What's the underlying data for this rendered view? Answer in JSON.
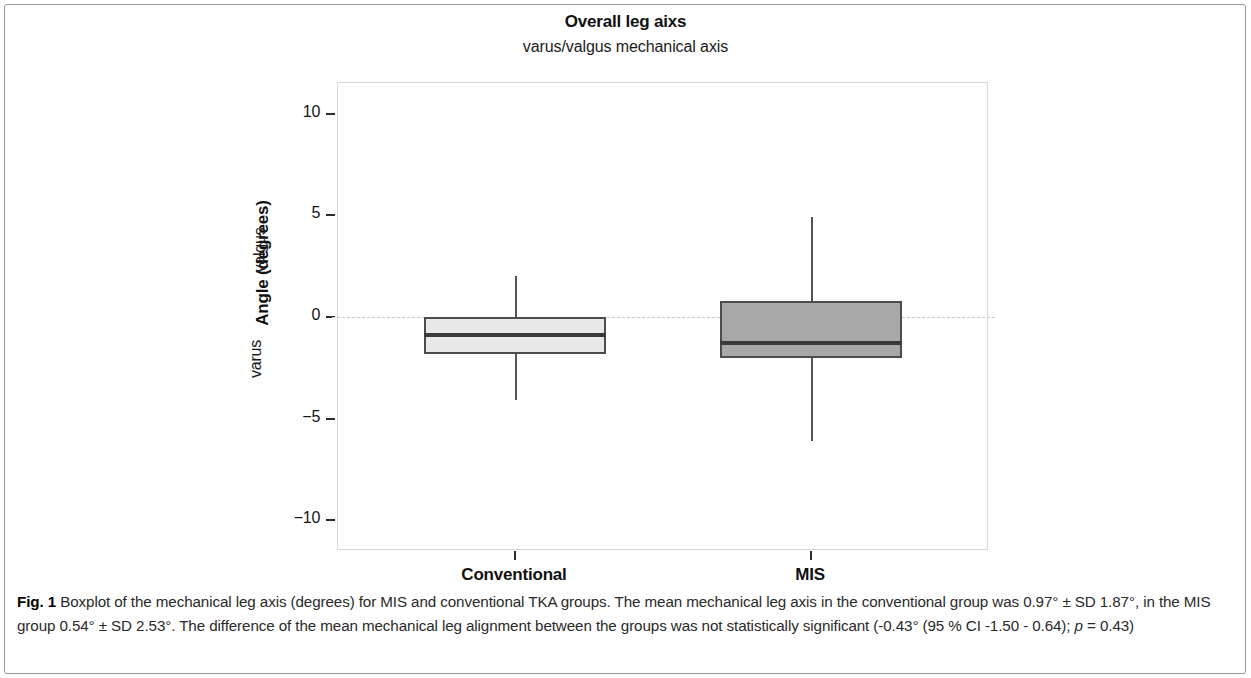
{
  "figure": {
    "label": "Fig. 1",
    "caption_text": " Boxplot of the mechanical leg axis (degrees) for MIS and conventional TKA groups. The mean mechanical leg axis in the conventional group was 0.97° ± SD 1.87°, in the MIS group 0.54° ± SD 2.53°. The difference of the mean mechanical leg alignment between the groups was not statistically significant (-0.43° (95 % CI -1.50 - 0.64); ",
    "caption_stat_italic": "p",
    "caption_stat_tail": " = 0.43)"
  },
  "chart_data": {
    "type": "box",
    "title": "Overall leg aixs",
    "subtitle": "varus/valgus mechanical axis",
    "xlabel": "",
    "ylabel": "Angle (degrees)",
    "y_direction_upper": "valgus",
    "y_direction_lower": "varus",
    "ylim": [
      -11.5,
      11.5
    ],
    "yticks": [
      10,
      5,
      0,
      -5,
      -10
    ],
    "ytick_labels": [
      "10",
      "5",
      "0",
      "−5",
      "−10"
    ],
    "grid": false,
    "legend": "none",
    "zero_reference_line": 0,
    "categories": [
      "Conventional",
      "MIS"
    ],
    "boxes": [
      {
        "name": "Conventional",
        "whisker_low": -4.1,
        "q1": -1.8,
        "median": -0.8,
        "q3": 0.0,
        "whisker_high": 2.0,
        "fill": "#e8e8e8",
        "stroke": "#4c4c4c"
      },
      {
        "name": "MIS",
        "whisker_low": -6.1,
        "q1": -2.0,
        "median": -1.2,
        "q3": 0.8,
        "whisker_high": 4.9,
        "fill": "#a8a8a8",
        "stroke": "#4c4c4c"
      }
    ],
    "stats_reported": {
      "conventional_mean": "0.97°",
      "conventional_sd": "1.87°",
      "mis_mean": "0.54°",
      "mis_sd": "2.53°",
      "mean_difference": "-0.43°",
      "ci_95": "-1.50 - 0.64",
      "p_value": "0.43"
    }
  }
}
